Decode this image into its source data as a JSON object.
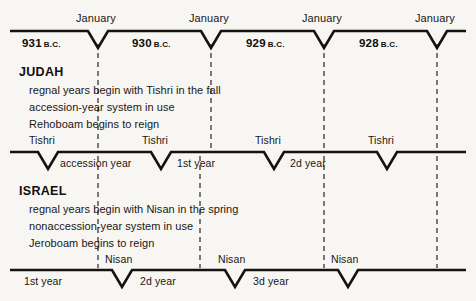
{
  "diagram": {
    "background_color": "#f7f6f3",
    "ink_color": "#16120f"
  },
  "top_axis": {
    "month_label": "January",
    "months": [
      {
        "label": "January",
        "x": 98
      },
      {
        "label": "January",
        "x": 211
      },
      {
        "label": "January",
        "x": 324
      },
      {
        "label": "January",
        "x": 437
      }
    ],
    "years": [
      {
        "value": "931",
        "era": "B.C.",
        "x": 22
      },
      {
        "value": "930",
        "era": "B.C.",
        "x": 132
      },
      {
        "value": "929",
        "era": "B.C.",
        "x": 246
      },
      {
        "value": "928",
        "era": "B.C.",
        "x": 359
      }
    ]
  },
  "judah": {
    "heading": "JUDAH",
    "notes": [
      "regnal years begin with Tishri in the fall",
      "accession-year system in use",
      "Rehoboam begins to reign"
    ],
    "festival_label": "Tishri",
    "festivals": [
      {
        "label": "Tishri",
        "x": 48
      },
      {
        "label": "Tishri",
        "x": 161
      },
      {
        "label": "Tishri",
        "x": 274
      },
      {
        "label": "Tishri",
        "x": 387
      }
    ],
    "spans": [
      {
        "label": "accession year",
        "x": 60
      },
      {
        "label": "1st year",
        "x": 177
      },
      {
        "label": "2d year",
        "x": 290
      }
    ]
  },
  "israel": {
    "heading": "ISRAEL",
    "notes": [
      "regnal years begin with Nisan in the spring",
      "nonaccession-year system in use",
      "Jeroboam begins to reign"
    ],
    "festival_label": "Nisan",
    "festivals": [
      {
        "label": "Nisan",
        "x": 122
      },
      {
        "label": "Nisan",
        "x": 235
      },
      {
        "label": "Nisan",
        "x": 348
      }
    ],
    "spans": [
      {
        "label": "1st year",
        "x": 24
      },
      {
        "label": "2d year",
        "x": 140
      },
      {
        "label": "3d year",
        "x": 253
      }
    ]
  }
}
